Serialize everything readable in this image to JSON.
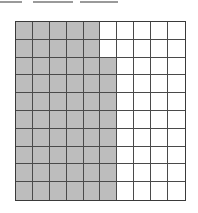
{
  "worksheet": {
    "answer_blanks": [
      {
        "left": 0,
        "width": 22
      },
      {
        "left": 33,
        "width": 40
      },
      {
        "left": 80,
        "width": 38
      }
    ]
  },
  "hundred_grid": {
    "rows": 10,
    "cols": 10,
    "shaded_count": 58,
    "total_cells": 100,
    "shade_color": "#bdbdbd",
    "line_color": "#4a4a4a",
    "shaded_by_row": [
      5,
      5,
      6,
      6,
      6,
      6,
      6,
      6,
      6,
      6
    ]
  }
}
